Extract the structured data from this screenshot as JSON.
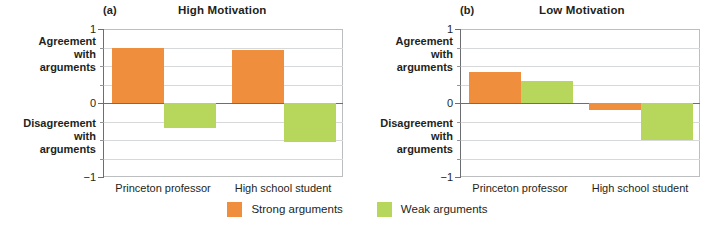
{
  "chart_data": {
    "type": "bar",
    "title": "",
    "panels": [
      {
        "tag": "(a)",
        "title": "High Motivation",
        "categories": [
          "Princeton professor",
          "High school student"
        ],
        "series": [
          {
            "name": "Strong arguments",
            "color": "#ef8e3c",
            "values": [
              0.74,
              0.72
            ]
          },
          {
            "name": "Weak arguments",
            "color": "#b6d65c",
            "values": [
              -0.34,
              -0.53
            ]
          }
        ],
        "ylim": [
          -1,
          1
        ],
        "yticks": [
          1,
          0,
          -1
        ],
        "ytick_labels": [
          "1",
          "0",
          "−1"
        ],
        "minor_gridlines": [
          0.75,
          0.5,
          0.25,
          -0.25,
          -0.5,
          -0.75
        ],
        "axis_top_label": "Agreement\nwith\narguments",
        "axis_bottom_label": "Disagreement\nwith\narguments",
        "grid": true
      },
      {
        "tag": "(b)",
        "title": "Low Motivation",
        "categories": [
          "Princeton professor",
          "High school student"
        ],
        "series": [
          {
            "name": "Strong arguments",
            "color": "#ef8e3c",
            "values": [
              0.42,
              -0.09
            ]
          },
          {
            "name": "Weak arguments",
            "color": "#b6d65c",
            "values": [
              0.3,
              -0.5
            ]
          }
        ],
        "ylim": [
          -1,
          1
        ],
        "yticks": [
          1,
          0,
          -1
        ],
        "ytick_labels": [
          "1",
          "0",
          "−1"
        ],
        "minor_gridlines": [
          0.75,
          0.5,
          0.25,
          -0.25,
          -0.5,
          -0.75
        ],
        "axis_top_label": "Agreement\nwith\narguments",
        "axis_bottom_label": "Disagreement\nwith\narguments",
        "grid": true
      }
    ],
    "legend": {
      "position": "bottom-center",
      "entries": [
        {
          "label": "Strong arguments",
          "color": "#ef8e3c"
        },
        {
          "label": "Weak arguments",
          "color": "#b6d65c"
        }
      ]
    }
  },
  "panel_a": {
    "tag": "(a)",
    "title": "High Motivation",
    "y_top": "1",
    "y_mid": "0",
    "y_bot": "−1",
    "agree_line1": "Agreement",
    "agree_line2": "with",
    "agree_line3": "arguments",
    "disagree_line1": "Disagreement",
    "disagree_line2": "with",
    "disagree_line3": "arguments",
    "cat1": "Princeton professor",
    "cat2": "High school student"
  },
  "panel_b": {
    "tag": "(b)",
    "title": "Low Motivation",
    "y_top": "1",
    "y_mid": "0",
    "y_bot": "−1",
    "agree_line1": "Agreement",
    "agree_line2": "with",
    "agree_line3": "arguments",
    "disagree_line1": "Disagreement",
    "disagree_line2": "with",
    "disagree_line3": "arguments",
    "cat1": "Princeton professor",
    "cat2": "High school student"
  },
  "legend": {
    "strong_label": "Strong arguments",
    "weak_label": "Weak arguments"
  },
  "colors": {
    "strong": "#ef8e3c",
    "weak": "#b6d65c",
    "axis": "#6d6e71",
    "grid": "#d7d8da"
  }
}
